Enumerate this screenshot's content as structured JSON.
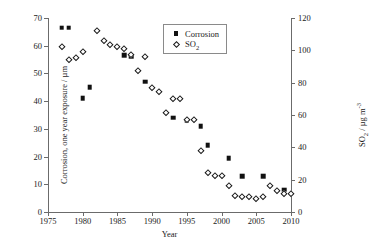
{
  "chart_data": {
    "type": "scatter",
    "title": "",
    "xlabel": "Year",
    "ylabel": "Corrosion, one year exposure / µm",
    "ylabel_right": "SO2 / µg m-3",
    "xlim": [
      1975,
      2010
    ],
    "ylim": [
      0,
      70
    ],
    "ylim_right": [
      0,
      120
    ],
    "xticks": [
      1975,
      1980,
      1985,
      1990,
      1995,
      2000,
      2005,
      2010
    ],
    "yticks_left": [
      0,
      10,
      20,
      30,
      40,
      50,
      60,
      70
    ],
    "yticks_right": [
      0,
      20,
      40,
      60,
      80,
      100,
      120
    ],
    "grid": false,
    "legend_position": "top-right-inside",
    "series": [
      {
        "name": "Corrosion",
        "axis": "left",
        "marker": "filled-square",
        "color": "#111111",
        "points": [
          {
            "x": 1977,
            "y": 66.5
          },
          {
            "x": 1978,
            "y": 66.5
          },
          {
            "x": 1980,
            "y": 41.0
          },
          {
            "x": 1981,
            "y": 45.0
          },
          {
            "x": 1986,
            "y": 56.5
          },
          {
            "x": 1987,
            "y": 56.0
          },
          {
            "x": 1989,
            "y": 47.0
          },
          {
            "x": 1993,
            "y": 34.0
          },
          {
            "x": 1995,
            "y": 33.0
          },
          {
            "x": 1997,
            "y": 31.0
          },
          {
            "x": 1998,
            "y": 24.0
          },
          {
            "x": 2001,
            "y": 19.5
          },
          {
            "x": 2003,
            "y": 13.0
          },
          {
            "x": 2006,
            "y": 13.0
          },
          {
            "x": 2009,
            "y": 8.0
          }
        ]
      },
      {
        "name": "SO2",
        "axis": "right",
        "marker": "open-diamond",
        "color": "#1a1a1a",
        "points": [
          {
            "x": 1977,
            "y": 102
          },
          {
            "x": 1978,
            "y": 94
          },
          {
            "x": 1979,
            "y": 95
          },
          {
            "x": 1980,
            "y": 99
          },
          {
            "x": 1982,
            "y": 112
          },
          {
            "x": 1983,
            "y": 106
          },
          {
            "x": 1984,
            "y": 103
          },
          {
            "x": 1985,
            "y": 102
          },
          {
            "x": 1986,
            "y": 101
          },
          {
            "x": 1987,
            "y": 97
          },
          {
            "x": 1988,
            "y": 87
          },
          {
            "x": 1989,
            "y": 96
          },
          {
            "x": 1990,
            "y": 77
          },
          {
            "x": 1991,
            "y": 74
          },
          {
            "x": 1992,
            "y": 61
          },
          {
            "x": 1993,
            "y": 70
          },
          {
            "x": 1994,
            "y": 70
          },
          {
            "x": 1995,
            "y": 57
          },
          {
            "x": 1996,
            "y": 57
          },
          {
            "x": 1997,
            "y": 38
          },
          {
            "x": 1998,
            "y": 24
          },
          {
            "x": 1999,
            "y": 22
          },
          {
            "x": 2000,
            "y": 22
          },
          {
            "x": 2001,
            "y": 16
          },
          {
            "x": 2002,
            "y": 10
          },
          {
            "x": 2003,
            "y": 9
          },
          {
            "x": 2004,
            "y": 9
          },
          {
            "x": 2005,
            "y": 8
          },
          {
            "x": 2006,
            "y": 9
          },
          {
            "x": 2007,
            "y": 16
          },
          {
            "x": 2008,
            "y": 13
          },
          {
            "x": 2009,
            "y": 11
          },
          {
            "x": 2010,
            "y": 11
          }
        ]
      }
    ]
  },
  "legend": {
    "items": [
      {
        "label": "Corrosion",
        "marker": "filled-square"
      },
      {
        "label": "SO2",
        "marker": "open-diamond"
      }
    ]
  },
  "axes": {
    "x_title": "Year",
    "y_left_title": "Corrosion, one year exposure / µm",
    "y_right_title": "SO2 / µg m-3"
  }
}
